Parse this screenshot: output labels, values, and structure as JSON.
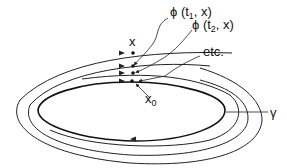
{
  "diagram": {
    "type": "phase-portrait-periodic-orbit",
    "labels": {
      "phi_t1": "ϕ (t",
      "phi_t1_sub": "1",
      "phi_t1_tail": ", x)",
      "phi_t2": "ϕ (t",
      "phi_t2_sub": "2",
      "phi_t2_tail": ", x)",
      "x": "x",
      "etc": "etc.",
      "x0": "x",
      "x0_sub": "0",
      "gamma": "γ"
    },
    "colors": {
      "stroke": "#222222",
      "background": "#ffffff"
    },
    "orbits": [
      {
        "name": "periodic-orbit-gamma",
        "cx": 135,
        "cy": 110,
        "rx": 98,
        "ry": 40
      },
      {
        "name": "trajectory-ring-2",
        "cx": 135,
        "cy": 110,
        "rx": 112,
        "ry": 50
      },
      {
        "name": "trajectory-ring-3",
        "cx": 135,
        "cy": 110,
        "rx": 125,
        "ry": 60
      }
    ]
  }
}
